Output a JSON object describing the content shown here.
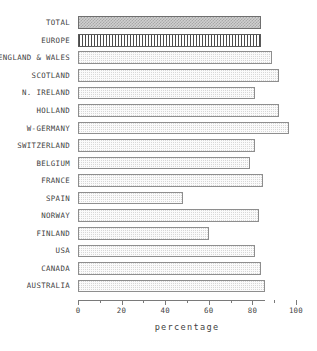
{
  "chart_data": {
    "type": "bar",
    "orientation": "horizontal",
    "title": "",
    "xlabel": "percentage",
    "ylabel": "",
    "xlim": [
      0,
      100
    ],
    "grid": false,
    "legend": null,
    "xticks_major": [
      0,
      20,
      40,
      60,
      80,
      100
    ],
    "xticks_minor": [
      10,
      30,
      50,
      70,
      90
    ],
    "xtick_labels": [
      "0",
      "20",
      "40",
      "60",
      "80",
      "100"
    ],
    "categories": [
      "TOTAL",
      "EUROPE",
      "ENGLAND & WALES",
      "SCOTLAND",
      "N. IRELAND",
      "HOLLAND",
      "W-GERMANY",
      "SWITZERLAND",
      "BELGIUM",
      "FRANCE",
      "SPAIN",
      "NORWAY",
      "FINLAND",
      "USA",
      "CANADA",
      "AUSTRALIA"
    ],
    "values": [
      84,
      84,
      89,
      92,
      81,
      92,
      97,
      81,
      79,
      85,
      48,
      83,
      60,
      81,
      84,
      86
    ],
    "bar_styles": [
      "checker",
      "vstripe",
      "stipple",
      "stipple",
      "stipple",
      "stipple",
      "stipple",
      "stipple",
      "stipple",
      "stipple",
      "stipple",
      "stipple",
      "stipple",
      "stipple",
      "stipple",
      "stipple"
    ],
    "colors": {
      "bar_fill_light": "#fbfbfb",
      "bar_fill_checker": "#cfcfcf",
      "bar_border": "#8e8e8e",
      "axis": "#7a7a7a",
      "text": "#3f3f3f",
      "background": "#ffffff"
    }
  }
}
